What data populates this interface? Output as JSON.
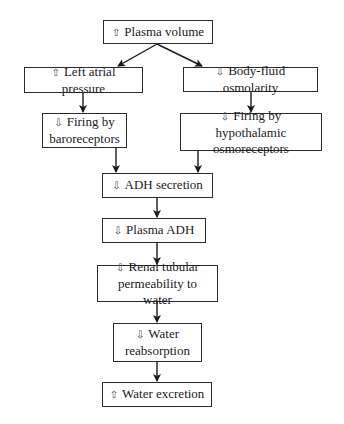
{
  "diagram": {
    "type": "flowchart",
    "glyphs": {
      "increase": "⇧",
      "decrease": "⇩"
    },
    "nodes": [
      {
        "id": "plasma_volume",
        "dir": "⇧",
        "label": "Plasma volume",
        "line2": ""
      },
      {
        "id": "left_atrial_pressure",
        "dir": "⇧",
        "label": "Left atrial pressure",
        "line2": ""
      },
      {
        "id": "body_fluid_osmolarity",
        "dir": "⇩",
        "label": "Body-fluid osmolarity",
        "line2": ""
      },
      {
        "id": "firing_baroreceptors",
        "dir": "⇩",
        "label": "Firing by",
        "line2": "baroreceptors"
      },
      {
        "id": "firing_osmoreceptors",
        "dir": "⇩",
        "label": "Firing by hypothalamic",
        "line2": "osmoreceptors"
      },
      {
        "id": "adh_secretion",
        "dir": "⇩",
        "label": "ADH secretion",
        "line2": ""
      },
      {
        "id": "plasma_adh",
        "dir": "⇩",
        "label": "Plasma ADH",
        "line2": ""
      },
      {
        "id": "renal_permeability",
        "dir": "⇩",
        "label": "Renal tubular",
        "line2": "permeability to water"
      },
      {
        "id": "water_reabsorption",
        "dir": "⇩",
        "label": "Water",
        "line2": "reabsorption"
      },
      {
        "id": "water_excretion",
        "dir": "⇧",
        "label": "Water excretion",
        "line2": ""
      }
    ],
    "edges": [
      {
        "from": "plasma_volume",
        "to": "left_atrial_pressure"
      },
      {
        "from": "plasma_volume",
        "to": "body_fluid_osmolarity"
      },
      {
        "from": "left_atrial_pressure",
        "to": "firing_baroreceptors"
      },
      {
        "from": "body_fluid_osmolarity",
        "to": "firing_osmoreceptors"
      },
      {
        "from": "firing_baroreceptors",
        "to": "adh_secretion"
      },
      {
        "from": "firing_osmoreceptors",
        "to": "adh_secretion"
      },
      {
        "from": "adh_secretion",
        "to": "plasma_adh"
      },
      {
        "from": "plasma_adh",
        "to": "renal_permeability"
      },
      {
        "from": "renal_permeability",
        "to": "water_reabsorption"
      },
      {
        "from": "water_reabsorption",
        "to": "water_excretion"
      }
    ]
  }
}
